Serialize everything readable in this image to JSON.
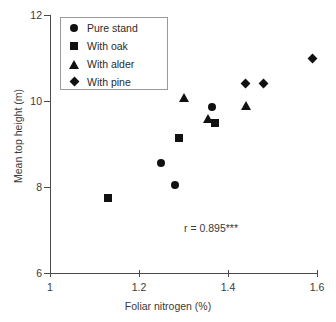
{
  "chart_data": {
    "type": "scatter",
    "title": "",
    "xlabel": "Foliar nitrogen (%)",
    "ylabel": "Mean top height (m)",
    "xlim": [
      1,
      1.6
    ],
    "ylim": [
      6,
      12
    ],
    "xticks": [
      "1",
      "1.2",
      "1.4",
      "1.6"
    ],
    "xtick_values": [
      1,
      1.2,
      1.4,
      1.6
    ],
    "yticks": [
      "12",
      "10",
      "8",
      "6"
    ],
    "ytick_values": [
      12,
      10,
      8,
      6
    ],
    "grid": false,
    "legend_position": "top-left",
    "annotations": [
      {
        "text": "r = 0.895***",
        "x": 1.37,
        "y": 6.9
      }
    ],
    "series": [
      {
        "name": "Pure stand",
        "marker": "circle",
        "points": [
          {
            "x": 1.25,
            "y": 8.55
          },
          {
            "x": 1.28,
            "y": 8.05
          },
          {
            "x": 1.365,
            "y": 9.85
          }
        ]
      },
      {
        "name": "With oak",
        "marker": "square",
        "points": [
          {
            "x": 1.13,
            "y": 7.75
          },
          {
            "x": 1.29,
            "y": 9.15
          },
          {
            "x": 1.37,
            "y": 9.5
          }
        ]
      },
      {
        "name": "With alder",
        "marker": "triangle",
        "points": [
          {
            "x": 1.3,
            "y": 10.1
          },
          {
            "x": 1.355,
            "y": 9.6
          },
          {
            "x": 1.44,
            "y": 9.9
          }
        ]
      },
      {
        "name": "With pine",
        "marker": "diamond",
        "points": [
          {
            "x": 1.44,
            "y": 10.4
          },
          {
            "x": 1.48,
            "y": 10.4
          },
          {
            "x": 1.59,
            "y": 11.0
          }
        ]
      }
    ]
  }
}
